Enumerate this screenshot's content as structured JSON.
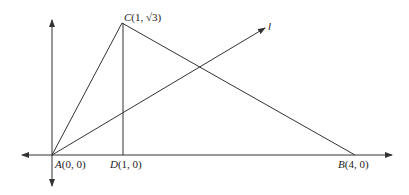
{
  "diagram": {
    "points": {
      "A": {
        "label": "A",
        "coords": "(0, 0)"
      },
      "B": {
        "label": "B",
        "coords": "(4, 0)"
      },
      "C": {
        "label": "C",
        "coords": "(1, √3)"
      },
      "D": {
        "label": "D",
        "coords": "(1, 0)"
      }
    },
    "line_label": "l",
    "stroke_color": "#333333"
  }
}
